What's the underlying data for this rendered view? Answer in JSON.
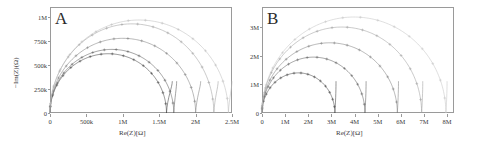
{
  "figure": {
    "type": "two-panel-nyquist-figure",
    "background": "#ffffff",
    "axis_color": "#9a9a9a",
    "text_color": "#3a3a3a"
  },
  "chart_data": [
    {
      "type": "line",
      "panel": "A",
      "panel_letter": "A",
      "title": "",
      "xlabel": "Re(Z)[Ω]",
      "ylabel": "−Im(Z)(Ω)",
      "xlim": [
        0,
        2500000
      ],
      "ylim": [
        0,
        1100000
      ],
      "xticks": [
        0,
        500000,
        1000000,
        1500000,
        2000000,
        2500000
      ],
      "xticklabels": [
        "0",
        "500k",
        "1M",
        "1.5M",
        "2M",
        "2.5M"
      ],
      "yticks": [
        0,
        250000,
        500000,
        750000,
        1000000
      ],
      "yticklabels": [
        "0",
        "250k",
        "500k",
        "750k",
        "1M"
      ],
      "grid": false,
      "legend": "none",
      "series": [
        {
          "name": "arc-1",
          "color": "#3c3c3c",
          "marker": "plus",
          "apex_x": 800000,
          "apex_y": 615000,
          "x_end": 1600000,
          "tail_x": 1680000
        },
        {
          "name": "arc-2",
          "color": "#5a5a5a",
          "marker": "plus",
          "apex_x": 900000,
          "apex_y": 660000,
          "x_end": 1700000,
          "tail_x": 1740000
        },
        {
          "name": "arc-3",
          "color": "#7d7d7d",
          "marker": "plus",
          "apex_x": 1000000,
          "apex_y": 775000,
          "x_end": 2000000,
          "tail_x": 2070000
        },
        {
          "name": "arc-4",
          "color": "#9e9e9e",
          "marker": "plus",
          "apex_x": 1150000,
          "apex_y": 925000,
          "x_end": 2250000,
          "tail_x": 2310000
        },
        {
          "name": "arc-5",
          "color": "#bdbdbd",
          "marker": "plus",
          "apex_x": 1250000,
          "apex_y": 965000,
          "x_end": 2450000,
          "tail_x": 2500000
        }
      ]
    },
    {
      "type": "line",
      "panel": "B",
      "panel_letter": "B",
      "title": "",
      "xlabel": "Re(Z)[Ω]",
      "ylabel": "",
      "xlim": [
        0,
        8300000
      ],
      "ylim": [
        0,
        3700000
      ],
      "xticks": [
        0,
        1000000,
        2000000,
        3000000,
        4000000,
        5000000,
        6000000,
        7000000,
        8000000
      ],
      "xticklabels": [
        "0",
        "1M",
        "2M",
        "3M",
        "4M",
        "5M",
        "6M",
        "7M",
        "8M"
      ],
      "yticks": [
        0,
        1000000,
        2000000,
        3000000
      ],
      "yticklabels": [
        "0",
        "1M",
        "2M",
        "3M"
      ],
      "grid": false,
      "legend": "none",
      "series": [
        {
          "name": "arc-1",
          "color": "#3c3c3c",
          "marker": "plus",
          "apex_x": 1700000,
          "apex_y": 1400000,
          "x_end": 3150000,
          "tail_x": 3200000
        },
        {
          "name": "arc-2",
          "color": "#5a5a5a",
          "marker": "plus",
          "apex_x": 2250000,
          "apex_y": 1950000,
          "x_end": 4450000,
          "tail_x": 4500000
        },
        {
          "name": "arc-3",
          "color": "#7d7d7d",
          "marker": "plus",
          "apex_x": 2950000,
          "apex_y": 2450000,
          "x_end": 5850000,
          "tail_x": 5900000
        },
        {
          "name": "arc-4",
          "color": "#9e9e9e",
          "marker": "plus",
          "apex_x": 3500000,
          "apex_y": 3000000,
          "x_end": 6900000,
          "tail_x": 6950000
        },
        {
          "name": "arc-5",
          "color": "#c4c4c4",
          "marker": "plus",
          "apex_x": 4050000,
          "apex_y": 3350000,
          "x_end": 7950000,
          "tail_x": 8000000
        }
      ]
    }
  ]
}
